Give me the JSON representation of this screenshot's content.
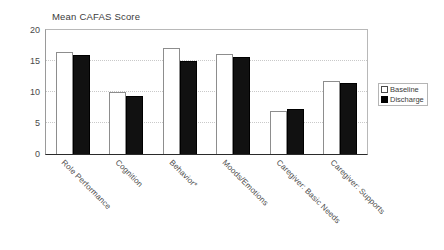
{
  "chart_data": {
    "type": "bar",
    "title": "Mean CAFAS Score",
    "xlabel": "",
    "ylabel": "",
    "ylim": [
      0,
      20
    ],
    "yticks": [
      0,
      5,
      10,
      15,
      20
    ],
    "grid": true,
    "legend_position": "right",
    "categories": [
      "Role Performance",
      "Cognition",
      "Behavior*",
      "Moods/Emotions",
      "Caregiver: Basic Needs",
      "Caregiver: Supports"
    ],
    "series": [
      {
        "name": "Baseline",
        "color": "#ffffff",
        "values": [
          16.5,
          10.0,
          17.1,
          16.1,
          7.0,
          11.7
        ]
      },
      {
        "name": "Discharge",
        "color": "#000000",
        "values": [
          16.0,
          9.4,
          15.0,
          15.6,
          7.2,
          11.4
        ]
      }
    ]
  },
  "legend": {
    "items": [
      {
        "label": "Baseline"
      },
      {
        "label": "Discharge"
      }
    ]
  }
}
